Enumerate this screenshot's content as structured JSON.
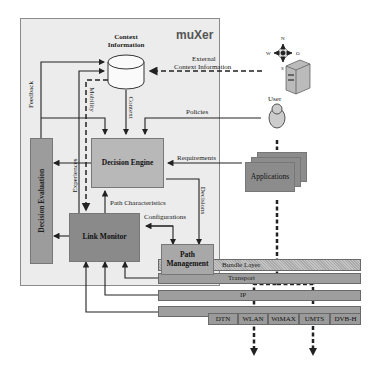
{
  "diagram": {
    "logo": "muXer",
    "blocks": {
      "context_information": "Context Information",
      "decision_engine": "Decision Engine",
      "decision_evaluation": "Decision Evaluation",
      "link_monitor": "Link Monitor",
      "path_management": "Path Management",
      "applications": "Applications",
      "user": "User"
    },
    "edge_labels": {
      "feedback": "Feedback",
      "mobility": "Mobility",
      "context": "Context",
      "external_context_line1": "External",
      "external_context_line2": "Context Information",
      "policies": "Policies",
      "requirements": "Requirements",
      "experiences": "Experiences",
      "path_characteristics": "Path Characteristics",
      "decisions": "Decisions",
      "configurations": "Configurations"
    },
    "layers": {
      "bundle": "Bundle Layer",
      "transport": "Transport",
      "ip": "IP"
    },
    "networks": [
      "DTN",
      "WLAN",
      "WiMAX",
      "UMTS",
      "DVB-H"
    ],
    "compass": {
      "n": "N",
      "w": "W",
      "o": "O",
      "s": "S"
    },
    "colors": {
      "panel": "#e8e8e8",
      "decision_engine": "#b8b8b8",
      "link_monitor": "#8a8a8a",
      "decision_evaluation": "#9c9c9c",
      "path_management": "#a8a8a8",
      "layer": "#9e9e9e",
      "applications": "#8c8c8c"
    }
  }
}
